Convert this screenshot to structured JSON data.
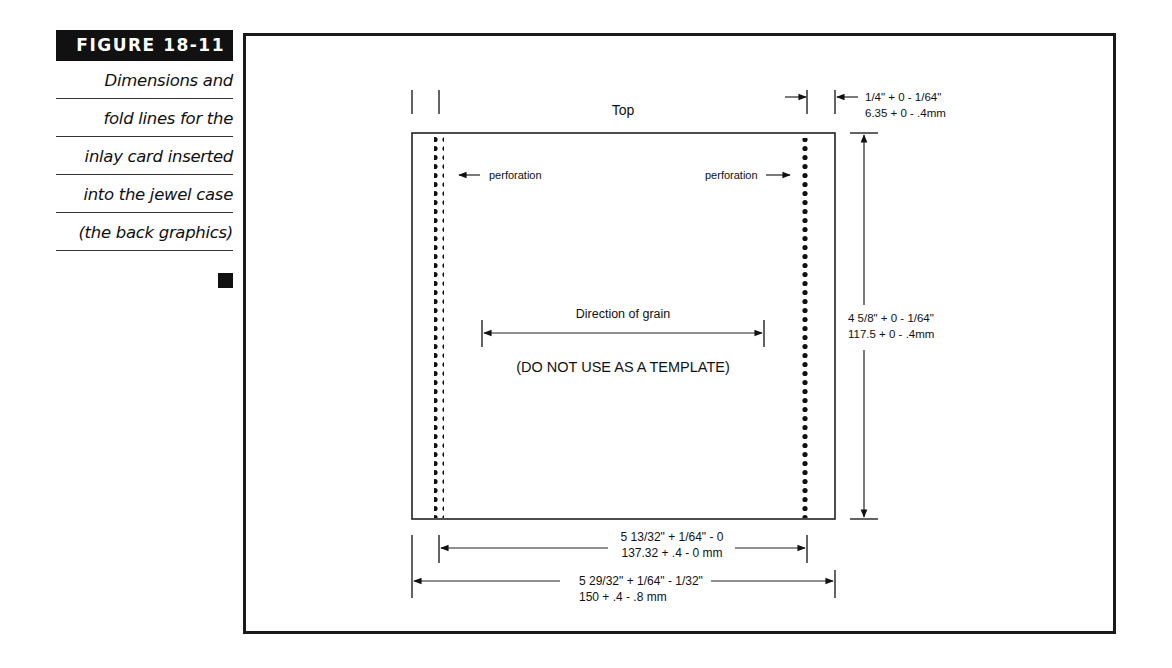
{
  "caption": {
    "figure_label": "FIGURE 18-11",
    "lines": [
      "Dimensions and",
      "fold lines for the",
      "inlay card inserted",
      "into the jewel case",
      "(the back graphics)"
    ]
  },
  "diagram": {
    "top_label": "Top",
    "perforation_left": "perforation",
    "perforation_right": "perforation",
    "grain_label": "Direction of grain",
    "warning": "(DO NOT USE AS A TEMPLATE)",
    "spine_dim": {
      "imperial": "1/4\" + 0 - 1/64\"",
      "metric": "6.35 + 0 - .4mm"
    },
    "height_dim": {
      "imperial": "4 5/8\" + 0 - 1/64\"",
      "metric": "117.5 + 0 - .4mm"
    },
    "inner_width_dim": {
      "imperial": "5 13/32\" + 1/64\" - 0",
      "metric": "137.32 + .4 - 0 mm"
    },
    "outer_width_dim": {
      "imperial": "5 29/32\" + 1/64\" - 1/32\"",
      "metric": "150 + .4 - .8 mm"
    }
  }
}
